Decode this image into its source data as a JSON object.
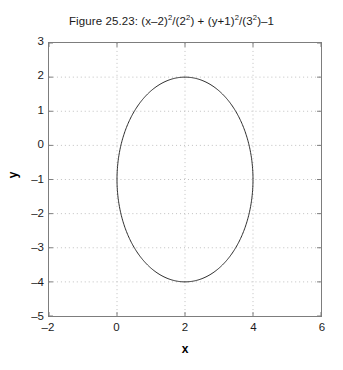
{
  "chart_data": {
    "type": "line",
    "title": "Figure 25.23: (x–2)2/(22) + (y+1)2/(32)–1",
    "title_parts": [
      {
        "text": "Figure 25.23: (x–2)",
        "sup": false
      },
      {
        "text": "2",
        "sup": true
      },
      {
        "text": "/(2",
        "sup": false
      },
      {
        "text": "2",
        "sup": true
      },
      {
        "text": ") + (y+1)",
        "sup": false
      },
      {
        "text": "2",
        "sup": true
      },
      {
        "text": "/(3",
        "sup": false
      },
      {
        "text": "2",
        "sup": true
      },
      {
        "text": ")–1",
        "sup": false
      }
    ],
    "xlabel": "x",
    "ylabel": "y",
    "xlim": [
      -2,
      6
    ],
    "ylim": [
      -5,
      3
    ],
    "xticks": [
      -2,
      0,
      2,
      4,
      6
    ],
    "yticks": [
      3,
      2,
      1,
      0,
      -1,
      -2,
      -3,
      -4,
      -5
    ],
    "xtick_labels": [
      "–2",
      "0",
      "2",
      "4",
      "6"
    ],
    "ytick_labels": [
      "3",
      "2",
      "1",
      "0",
      "–1",
      "–2",
      "–3",
      "–4",
      "–5"
    ],
    "grid": true,
    "grid_style": "dotted",
    "grid_color": "#bfbfbf",
    "legend": null,
    "axes_color": "#7d7d7d",
    "curve_color": "#2b2b2b",
    "curve_width": 1,
    "series": [
      {
        "name": "ellipse",
        "equation": "(x–2)²/2² + (y+1)²/3² = 1",
        "shape": "ellipse",
        "center": [
          2,
          -1
        ],
        "semi_axis_x": 2,
        "semi_axis_y": 3,
        "x_extent": [
          0,
          4
        ],
        "y_extent": [
          -4,
          2
        ]
      }
    ]
  }
}
